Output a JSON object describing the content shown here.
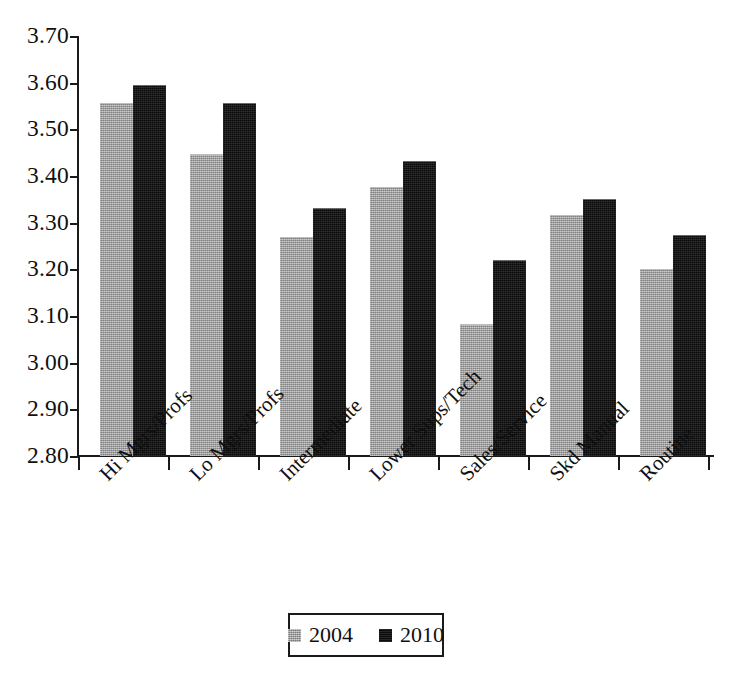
{
  "chart_data": {
    "type": "bar",
    "title": "",
    "xlabel": "",
    "ylabel": "",
    "ylim": [
      2.8,
      3.7
    ],
    "ytick_step": 0.1,
    "grid": false,
    "legend_position": "bottom-center",
    "categories": [
      "Hi Mgrs/Profs",
      "Lo Mgrs/Profs",
      "Intermediate",
      "Lower Sups/Tech",
      "Sales/Service",
      "Skd Manual",
      "Routine"
    ],
    "ytick_labels": [
      "3.70",
      "3.60",
      "3.50",
      "3.40",
      "3.30",
      "3.20",
      "3.10",
      "3.00",
      "2.90",
      "2.80"
    ],
    "ytick_values": [
      3.7,
      3.6,
      3.5,
      3.4,
      3.3,
      3.2,
      3.1,
      3.0,
      2.9,
      2.8
    ],
    "series": [
      {
        "name": "2004",
        "color": "#9a9a9a",
        "values": [
          3.555,
          3.445,
          3.268,
          3.375,
          3.08,
          3.315,
          3.198
        ]
      },
      {
        "name": "2010",
        "color": "#131313",
        "values": [
          3.592,
          3.555,
          3.33,
          3.43,
          3.218,
          3.348,
          3.272
        ]
      }
    ]
  },
  "legend": {
    "entries": [
      {
        "label": "2004",
        "swatch": "gray-swatch-icon"
      },
      {
        "label": "2010",
        "swatch": "black-swatch-icon"
      }
    ]
  },
  "colors": {
    "series_2004": "#9a9a9a",
    "series_2010": "#131313",
    "axis": "#1a1a1a",
    "background": "#ffffff",
    "text": "#101010"
  }
}
